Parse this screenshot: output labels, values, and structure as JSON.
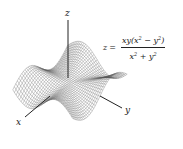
{
  "figure": {
    "function": "z = xy(x^2 - y^2)/(x^2 + y^2)",
    "axes": {
      "x_label": "x",
      "y_label": "y",
      "z_label": "z"
    },
    "formula": {
      "lhs": "z",
      "equals": "=",
      "numerator_xy": "xy(x",
      "numerator_mid": " − y",
      "numerator_close": ")",
      "denominator_x": "x",
      "denominator_plus": " + y",
      "exponent": "2"
    },
    "colors": {
      "mesh": "#555555",
      "axis": "#222222",
      "background": "#ffffff"
    },
    "mesh": {
      "range": 2.6,
      "steps": 36,
      "z_scale": 0.55
    }
  }
}
